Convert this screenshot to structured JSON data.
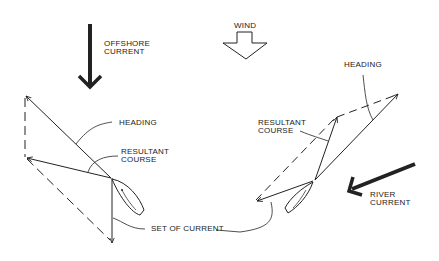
{
  "diagram": {
    "type": "vector-diagram",
    "colors": {
      "ink": "#222222",
      "background": "#ffffff"
    },
    "top": {
      "wind_label": "WIND",
      "offshore_current_line1": "OFFSHORE",
      "offshore_current_line2": "CURRENT"
    },
    "left_panel": {
      "heading_label": "HEADING",
      "resultant_line1": "RESULTANT",
      "resultant_line2": "COURSE",
      "set_label": "SET OF CURRENT"
    },
    "right_panel": {
      "heading_label": "HEADING",
      "resultant_line1": "RESULTANT",
      "resultant_line2": "COURSE",
      "river_current_line1": "RIVER",
      "river_current_line2": "CURRENT"
    },
    "icons": [
      "offshore-current-arrow",
      "wind-arrow",
      "river-current-arrow",
      "sailboat-hull"
    ]
  }
}
